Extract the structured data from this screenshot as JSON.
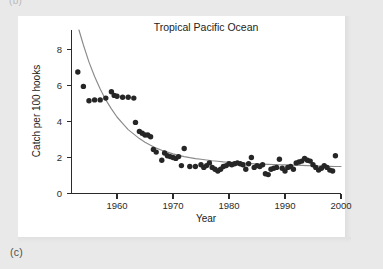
{
  "figure": {
    "panel_letter": "(c)",
    "top_fragment": "(b)",
    "background_color": "#e9e9e9",
    "panel_color": "#ffffff"
  },
  "chart_data": {
    "type": "scatter",
    "title": "Tropical Pacific Ocean",
    "xlabel": "Year",
    "ylabel": "Catch per 100 hooks",
    "xlim": [
      1952,
      2000
    ],
    "ylim": [
      0,
      9
    ],
    "xticks": [
      1960,
      1970,
      1980,
      1990,
      2000
    ],
    "xticklabels": [
      "1960",
      "1970",
      "1980",
      "1990",
      "2000"
    ],
    "yticks": [
      0,
      2,
      4,
      6,
      8
    ],
    "yticklabels": [
      "0",
      "2",
      "4",
      "6",
      "8"
    ],
    "grid": false,
    "legend": null,
    "marker_color": "#262626",
    "curve_color": "#8a8a8a",
    "axis_color": "#2b2b2b",
    "series": [
      {
        "name": "Catch per 100 hooks",
        "kind": "scatter",
        "x": [
          1953,
          1954,
          1955,
          1956,
          1957,
          1958,
          1959,
          1959.5,
          1960,
          1961,
          1962,
          1963,
          1963.3,
          1964,
          1964.5,
          1965,
          1965.5,
          1966,
          1966.5,
          1967,
          1968,
          1968.5,
          1969,
          1969.5,
          1970,
          1970.5,
          1971,
          1971.5,
          1972,
          1973,
          1974,
          1975,
          1975.5,
          1976,
          1976.5,
          1977,
          1977.5,
          1978,
          1978.5,
          1979,
          1979.5,
          1980,
          1980.5,
          1981,
          1981.5,
          1982,
          1982.5,
          1983,
          1983.5,
          1984,
          1984.5,
          1985,
          1985.5,
          1986,
          1986.5,
          1987,
          1987.5,
          1988,
          1988.5,
          1989,
          1989.5,
          1990,
          1990.5,
          1991,
          1991.5,
          1992,
          1992.5,
          1993,
          1993.5,
          1994,
          1994.5,
          1995,
          1995.5,
          1996,
          1996.5,
          1997,
          1997.5,
          1998,
          1998.5,
          1999
        ],
        "y": [
          6.75,
          5.95,
          5.15,
          5.2,
          5.2,
          5.3,
          5.65,
          5.45,
          5.4,
          5.35,
          5.35,
          5.3,
          3.95,
          3.45,
          3.35,
          3.25,
          3.25,
          3.15,
          2.45,
          2.3,
          1.85,
          2.25,
          2.1,
          2.05,
          2.0,
          1.95,
          2.05,
          1.55,
          2.5,
          1.5,
          1.5,
          1.6,
          1.45,
          1.55,
          1.7,
          1.45,
          1.35,
          1.25,
          1.35,
          1.5,
          1.55,
          1.65,
          1.6,
          1.65,
          1.7,
          1.65,
          1.6,
          1.35,
          1.65,
          2.0,
          1.45,
          1.55,
          1.5,
          1.6,
          1.1,
          1.05,
          1.35,
          1.4,
          1.45,
          1.9,
          1.4,
          1.25,
          1.45,
          1.5,
          1.35,
          1.7,
          1.75,
          1.8,
          1.95,
          1.85,
          1.8,
          1.6,
          1.45,
          1.3,
          1.4,
          1.55,
          1.45,
          1.3,
          1.25,
          2.1
        ]
      },
      {
        "name": "fitted exponential decay",
        "kind": "line",
        "description": "smooth declining curve from above 9 at 1953 to about 1.5 at 2000",
        "x": [
          1953.0,
          1954.0,
          1955.0,
          1956.0,
          1957.0,
          1958.0,
          1959.0,
          1960.0,
          1961.0,
          1962.0,
          1963.0,
          1964.0,
          1965.0,
          1966.0,
          1967.0,
          1968.0,
          1969.0,
          1970.0,
          1971.0,
          1972.0,
          1973.0,
          1974.0,
          1975.0,
          1976.0,
          1977.0,
          1978.0,
          1979.0,
          1980.0,
          1981.0,
          1982.0,
          1983.0,
          1984.0,
          1985.0,
          1986.0,
          1987.0,
          1988.0,
          1989.0,
          1990.0,
          1991.0,
          1992.0,
          1993.0,
          1994.0,
          1995.0,
          1996.0,
          1997.0,
          1998.0,
          1999.0,
          2000.0
        ],
        "y": [
          9.3,
          8.25,
          7.3,
          6.5,
          5.8,
          5.2,
          4.7,
          4.25,
          3.9,
          3.55,
          3.3,
          3.05,
          2.85,
          2.68,
          2.52,
          2.4,
          2.3,
          2.2,
          2.12,
          2.05,
          1.99,
          1.94,
          1.9,
          1.86,
          1.82,
          1.79,
          1.76,
          1.74,
          1.72,
          1.7,
          1.68,
          1.66,
          1.64,
          1.63,
          1.62,
          1.61,
          1.6,
          1.59,
          1.58,
          1.57,
          1.56,
          1.55,
          1.54,
          1.53,
          1.52,
          1.51,
          1.5,
          1.5
        ]
      }
    ]
  }
}
